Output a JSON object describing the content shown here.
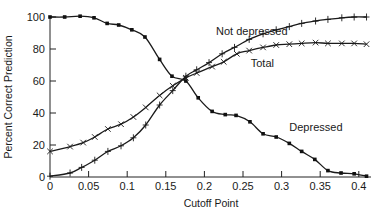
{
  "chart_data": {
    "type": "line",
    "title": "",
    "xlabel": "Cutoff Point",
    "ylabel": "Percent Correct Prediction",
    "xlim": [
      0,
      0.41
    ],
    "ylim": [
      0,
      100
    ],
    "xticks": [
      "0",
      "0.05",
      "0.1",
      "0.15",
      "0.2",
      "0.25",
      "0.3",
      "0.35",
      "0.4"
    ],
    "xtick_values": [
      0,
      0.05,
      0.1,
      0.15,
      0.2,
      0.25,
      0.3,
      0.35,
      0.4
    ],
    "yticks": [
      "0",
      "20",
      "40",
      "60",
      "80",
      "100"
    ],
    "ytick_values": [
      0,
      20,
      40,
      60,
      80,
      100
    ],
    "grid": false,
    "legend": "inline labels",
    "series": [
      {
        "name": "Not depressed",
        "marker": "plus",
        "x": [
          0.0,
          0.026,
          0.041,
          0.058,
          0.075,
          0.092,
          0.108,
          0.124,
          0.142,
          0.159,
          0.176,
          0.19,
          0.206,
          0.223,
          0.239,
          0.258,
          0.276,
          0.293,
          0.31,
          0.326,
          0.344,
          0.36,
          0.378,
          0.394,
          0.41
        ],
        "values": [
          0.5,
          2.5,
          6,
          10.5,
          16,
          19.5,
          24.5,
          32.5,
          45,
          54,
          63,
          67,
          71.5,
          77,
          81,
          86,
          89.5,
          92,
          94,
          96,
          97.5,
          98.5,
          99.5,
          100,
          100
        ]
      },
      {
        "name": "Total",
        "marker": "x",
        "x": [
          0.0,
          0.026,
          0.043,
          0.058,
          0.075,
          0.092,
          0.108,
          0.124,
          0.142,
          0.159,
          0.176,
          0.19,
          0.21,
          0.225,
          0.242,
          0.258,
          0.276,
          0.293,
          0.31,
          0.326,
          0.344,
          0.36,
          0.378,
          0.394,
          0.41
        ],
        "values": [
          16,
          19,
          21.5,
          25,
          30,
          33,
          37.5,
          43.5,
          51,
          57,
          62,
          65,
          69,
          72,
          77,
          79,
          81,
          82.5,
          83,
          83.5,
          84,
          83.5,
          83.5,
          83.5,
          83
        ]
      },
      {
        "name": "Depressed",
        "marker": "dot",
        "x": [
          0.0,
          0.019,
          0.039,
          0.057,
          0.074,
          0.089,
          0.106,
          0.123,
          0.142,
          0.158,
          0.176,
          0.192,
          0.21,
          0.227,
          0.241,
          0.259,
          0.276,
          0.293,
          0.31,
          0.326,
          0.343,
          0.36,
          0.377,
          0.394,
          0.41
        ],
        "values": [
          100,
          100,
          100.5,
          99.5,
          96,
          95,
          92,
          87.5,
          73.5,
          63,
          60,
          49.5,
          41,
          39,
          38.5,
          34.5,
          27,
          25,
          21,
          16,
          11,
          4,
          2.5,
          2,
          0.5
        ]
      }
    ],
    "annotations": [
      {
        "text": "Not depressed",
        "x": 0.215,
        "y": 89
      },
      {
        "text": "Total",
        "x": 0.26,
        "y": 69
      },
      {
        "text": "Depressed",
        "x": 0.31,
        "y": 29
      }
    ]
  }
}
